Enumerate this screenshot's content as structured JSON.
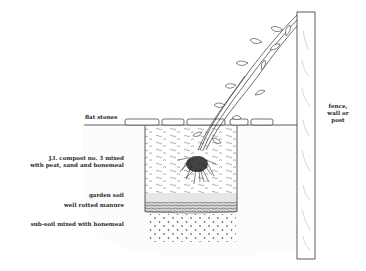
{
  "diagram": {
    "type": "planting-cross-section",
    "labels": {
      "flat_stones": "flat stones",
      "fence": [
        "fence,",
        "wall or",
        "post"
      ],
      "compost": [
        "J.I. compost no. 3 mixed",
        "with peat, sand and bonemeal"
      ],
      "garden_soil": "garden soil",
      "manure": "well rotted manure",
      "subsoil": "sub-soil mixed with bonemeal"
    },
    "colors": {
      "ink": "#2a2a2a",
      "soil_stipple": "#c8c8c8",
      "background": "#ffffff"
    }
  }
}
